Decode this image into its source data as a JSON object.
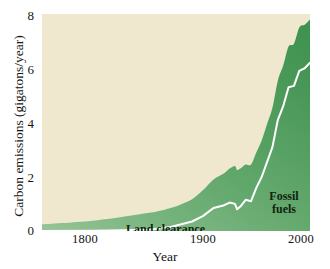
{
  "chart_data": {
    "type": "area",
    "title": "",
    "xlabel": "Year",
    "ylabel": "Carbon emissions (gigatons/year)",
    "xlim": [
      1750,
      2000
    ],
    "ylim": [
      0,
      8
    ],
    "xticks": [
      1800,
      1900,
      2000
    ],
    "yticks": [
      0,
      2,
      4,
      6,
      8
    ],
    "grid": false,
    "legend_position": "in-plot annotations",
    "stacked": true,
    "colors": {
      "plot_background": "#efe8ce",
      "area_fill_dark": "#4a9a55",
      "area_fill_light": "#8dc08d",
      "divider_line": "#ffffff",
      "text": "#141414"
    },
    "annotations": [
      {
        "text": "Land clearance",
        "x": 1820,
        "y": 0.55
      },
      {
        "text": "Fossil fuels",
        "x": 1968,
        "y": 1.6
      }
    ],
    "series": [
      {
        "name": "Fossil fuels",
        "note": "lower band: white line is the top of the fossil-fuel contribution",
        "x": [
          1750,
          1800,
          1850,
          1870,
          1880,
          1890,
          1900,
          1910,
          1920,
          1925,
          1930,
          1932,
          1935,
          1940,
          1945,
          1950,
          1955,
          1960,
          1965,
          1970,
          1975,
          1980,
          1985,
          1990,
          1995,
          2000
        ],
        "values": [
          0.0,
          0.01,
          0.05,
          0.15,
          0.25,
          0.35,
          0.55,
          0.85,
          0.95,
          1.05,
          1.0,
          0.8,
          0.9,
          1.15,
          1.1,
          1.6,
          2.0,
          2.55,
          3.1,
          4.1,
          4.6,
          5.3,
          5.35,
          5.9,
          6.0,
          6.2
        ]
      },
      {
        "name": "Land clearance",
        "note": "upper band: total minus fossil fuels",
        "x": [
          1750,
          1800,
          1850,
          1870,
          1880,
          1890,
          1900,
          1910,
          1920,
          1925,
          1930,
          1932,
          1935,
          1940,
          1945,
          1950,
          1955,
          1960,
          1965,
          1970,
          1975,
          1980,
          1985,
          1990,
          1995,
          2000
        ],
        "values": [
          0.25,
          0.38,
          0.62,
          0.7,
          0.74,
          0.82,
          0.95,
          1.05,
          1.18,
          1.25,
          1.4,
          1.45,
          1.4,
          1.3,
          1.35,
          1.3,
          1.35,
          1.4,
          1.45,
          1.45,
          1.5,
          1.5,
          1.55,
          1.6,
          1.6,
          1.6
        ]
      },
      {
        "name": "Total carbon emissions",
        "note": "outer top edge of the filled area",
        "x": [
          1750,
          1800,
          1850,
          1870,
          1880,
          1890,
          1900,
          1910,
          1920,
          1925,
          1930,
          1932,
          1935,
          1940,
          1945,
          1950,
          1955,
          1960,
          1965,
          1970,
          1975,
          1980,
          1985,
          1990,
          1995,
          2000
        ],
        "values": [
          0.25,
          0.39,
          0.67,
          0.85,
          0.99,
          1.17,
          1.5,
          1.9,
          2.13,
          2.3,
          2.4,
          2.25,
          2.3,
          2.45,
          2.45,
          2.9,
          3.35,
          3.95,
          4.55,
          5.55,
          6.1,
          6.8,
          6.9,
          7.5,
          7.6,
          7.8
        ]
      }
    ]
  },
  "axes": {
    "y_title": "Carbon emissions (gigatons/year)",
    "x_title": "Year",
    "y_ticks": [
      {
        "value": 8,
        "label": "8"
      },
      {
        "value": 6,
        "label": "6"
      },
      {
        "value": 4,
        "label": "4"
      },
      {
        "value": 2,
        "label": "2"
      },
      {
        "value": 0,
        "label": "0"
      }
    ],
    "x_ticks": [
      {
        "value": 1800,
        "label": "1800"
      },
      {
        "value": 1900,
        "label": "1900"
      },
      {
        "value": 2000,
        "label": "2000"
      }
    ]
  },
  "annotations": {
    "land_clearance": "Land clearance",
    "fossil_fuels_line1": "Fossil",
    "fossil_fuels_line2": "fuels"
  }
}
